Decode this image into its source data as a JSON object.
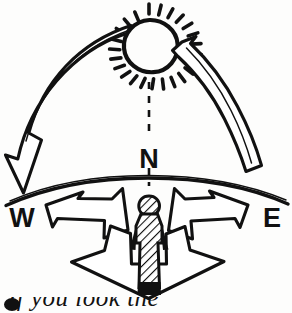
{
  "figure": {
    "style": "hand-drawn ink line illustration",
    "background_color": "#fdfdfc",
    "ink_color": "#111111"
  },
  "labels": {
    "north": "N",
    "west": "W",
    "east": "E"
  },
  "elements": {
    "sun": {
      "name": "sun",
      "ray_count": 20,
      "center_x": 149,
      "center_y": 45,
      "radius": 25
    },
    "sun_path_arc_left": {
      "name": "sun-path-arrow-west",
      "direction": "points down-left toward west horizon"
    },
    "sun_path_arc_right": {
      "name": "sun-path-arrow-east",
      "direction": "points up-left toward the sun from east horizon"
    },
    "meridian": {
      "name": "north-meridian-dashed-line",
      "style": "dashed vertical"
    },
    "horizon": {
      "name": "horizon-line",
      "style": "curved arc bulging upward"
    },
    "observer": {
      "name": "observer-figure",
      "style": "hatched standing human silhouette"
    },
    "ground_arrow": {
      "name": "three-way-direction-arrow",
      "points": [
        "west",
        "east",
        "south"
      ]
    }
  },
  "caption": {
    "bullet": "●",
    "text": "If you look the"
  }
}
